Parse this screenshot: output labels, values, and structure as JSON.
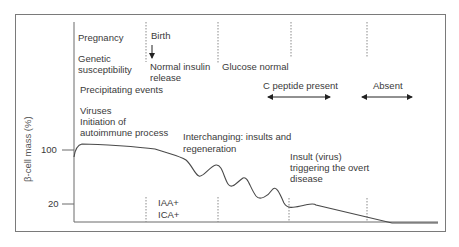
{
  "figure": {
    "y_axis_label": "β-cell mass (%)",
    "y_ticks": [
      {
        "label": "100",
        "y": 150
      },
      {
        "label": "20",
        "y": 204
      }
    ],
    "annotations": {
      "pregnancy": "Pregnancy",
      "genetic_1": "Genetic",
      "genetic_2": "susceptibility",
      "birth": "Birth",
      "normal_insulin_1": "Normal insulin",
      "normal_insulin_2": "release",
      "glucose_normal": "Glucose normal",
      "precipitating": "Precipitating events",
      "viruses": "Viruses",
      "initiation_1": "Initiation of",
      "initiation_2": "autoimmune process",
      "c_peptide": "C peptide present",
      "absent": "Absent",
      "interchanging_1": "Interchanging: insults and",
      "interchanging_2": "regeneration",
      "insult_1": "Insult (virus)",
      "insult_2": "triggering the overt",
      "insult_3": "disease",
      "iaa": "IAA+",
      "ica": "ICA+"
    },
    "colors": {
      "line": "#4a4a4a",
      "text": "#3a3a3a",
      "frame": "#7a7a7a",
      "dashed": "#8a8a8a"
    }
  }
}
